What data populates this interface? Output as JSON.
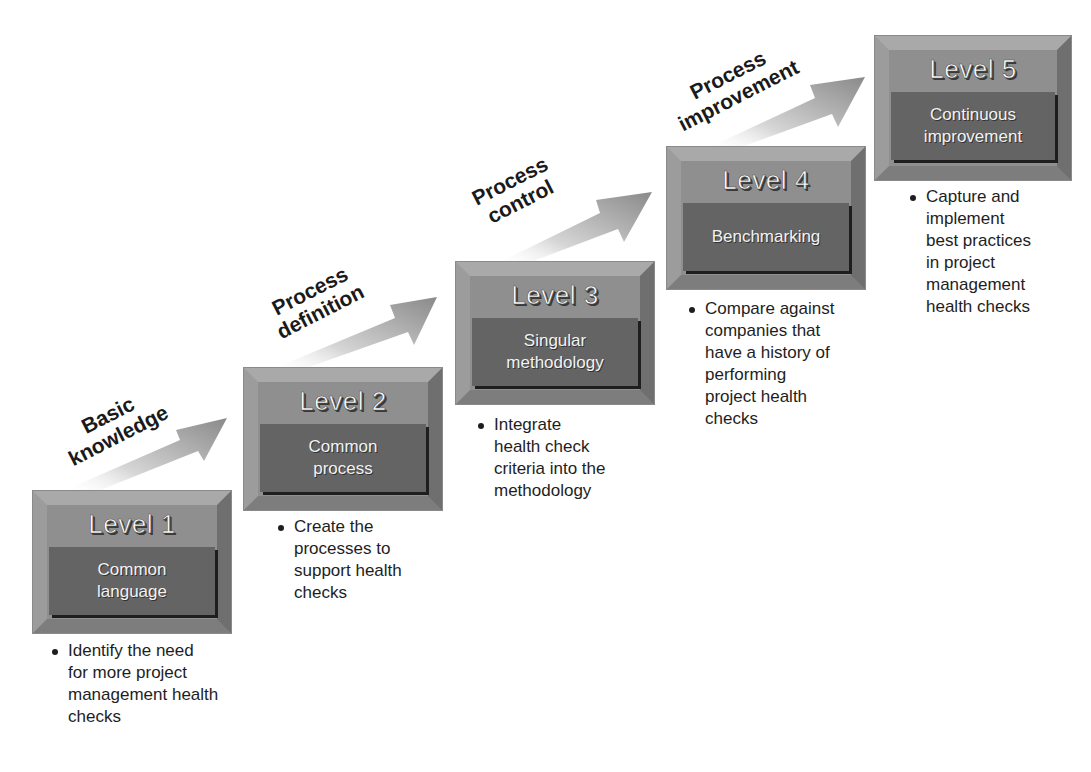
{
  "diagram": {
    "type": "maturity-staircase",
    "levels": [
      {
        "title": "Level 1",
        "name": "Common language",
        "name_lines": [
          "Common",
          "language"
        ],
        "bullet": "Identify the need for more project management health checks",
        "bullet_lines": [
          "Identify the need",
          "for more project",
          "management health",
          "checks"
        ]
      },
      {
        "title": "Level 2",
        "name": "Common process",
        "name_lines": [
          "Common",
          "process"
        ],
        "bullet": "Create the processes to support health checks",
        "bullet_lines": [
          "Create the",
          "processes to",
          "support health",
          "checks"
        ]
      },
      {
        "title": "Level 3",
        "name": "Singular methodology",
        "name_lines": [
          "Singular",
          "methodology"
        ],
        "bullet": "Integrate health check criteria into the methodology",
        "bullet_lines": [
          "Integrate",
          "health check",
          "criteria into the",
          "methodology"
        ]
      },
      {
        "title": "Level 4",
        "name": "Benchmarking",
        "name_lines": [
          "Benchmarking"
        ],
        "bullet": "Compare against companies that have a history of performing project health checks",
        "bullet_lines": [
          "Compare against",
          "companies that",
          "have a history of",
          "performing",
          "project health",
          "checks"
        ]
      },
      {
        "title": "Level 5",
        "name": "Continuous improvement",
        "name_lines": [
          "Continuous",
          "improvement"
        ],
        "bullet": "Capture and implement best practices in project management health checks",
        "bullet_lines": [
          "Capture and",
          "implement",
          "best practices",
          "in project",
          "management",
          "health checks"
        ]
      }
    ],
    "transitions": [
      {
        "from": "Level 1",
        "to": "Level 2",
        "label_lines": [
          "Basic",
          "knowledge"
        ]
      },
      {
        "from": "Level 2",
        "to": "Level 3",
        "label_lines": [
          "Process",
          "definition"
        ]
      },
      {
        "from": "Level 3",
        "to": "Level 4",
        "label_lines": [
          "Process",
          "control"
        ]
      },
      {
        "from": "Level 4",
        "to": "Level 5",
        "label_lines": [
          "Process",
          "improvement"
        ]
      }
    ],
    "colors": {
      "box_face": "#8f8f8f",
      "box_panel": "#646464",
      "title_text": "#ffffff",
      "arrow_head": "#8c8c8c",
      "arrow_tail": "#f0f0f0",
      "body_text": "#1e1e1e"
    }
  }
}
